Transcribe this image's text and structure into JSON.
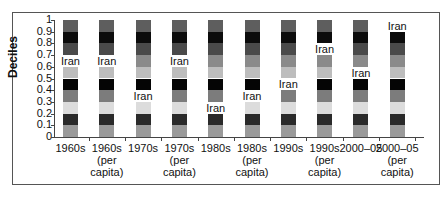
{
  "chart_data": {
    "type": "bar",
    "subtype": "stacked-decile",
    "title": "",
    "xlabel": "",
    "ylabel": "Deciles",
    "ylim": [
      0,
      1
    ],
    "yticks": [
      "0",
      "0.1",
      "0.2",
      "0.3",
      "0.4",
      "0.5",
      "0.6",
      "0.7",
      "0.8",
      "0.9",
      "1"
    ],
    "categories": [
      "1960s",
      "1960s (per capita)",
      "1970s",
      "1970s (per capita)",
      "1980s",
      "1980s (per capita)",
      "1990s",
      "1990s (per capita)",
      "2000–05",
      "2000–05 (per capita)"
    ],
    "category_lines": [
      [
        "1960s"
      ],
      [
        "1960s",
        "(per",
        "capita)"
      ],
      [
        "1970s"
      ],
      [
        "1970s",
        "(per",
        "capita)"
      ],
      [
        "1980s"
      ],
      [
        "1980s",
        "(per",
        "capita)"
      ],
      [
        "1990s"
      ],
      [
        "1990s",
        "(per",
        "capita)"
      ],
      [
        "2000–05"
      ],
      [
        "2000–05",
        "(per",
        "capita)"
      ]
    ],
    "iran_decile_start": [
      0.6,
      0.6,
      0.3,
      0.6,
      0.2,
      0.3,
      0.4,
      0.7,
      0.5,
      0.9
    ],
    "annotation_label": "Iran",
    "segment_colors": [
      "#9a9a9a",
      "#2a2a2a",
      "#dcdcdc",
      "#7c7c7c",
      "#050505",
      "#bdbdbd",
      "#8a8a8a",
      "#4a4a4a",
      "#0c0c0c",
      "#5e5e5e"
    ],
    "legend": "none",
    "grid": false
  }
}
